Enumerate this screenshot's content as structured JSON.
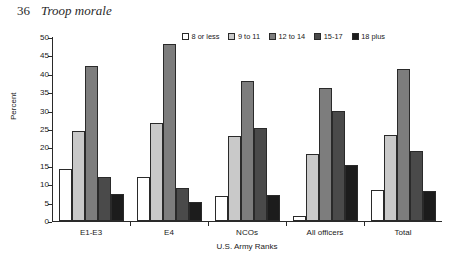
{
  "page": {
    "folio": "36",
    "running_title": "Troop morale"
  },
  "chart_data": {
    "type": "bar",
    "title": "",
    "xlabel": "U.S. Army Ranks",
    "ylabel": "Percent",
    "ylim": [
      0,
      50
    ],
    "ytick_step": 5,
    "yticks": [
      "0",
      "5",
      "10",
      "15",
      "20",
      "25",
      "30",
      "35",
      "40",
      "45",
      "50"
    ],
    "grid": false,
    "legend_position": "top-right",
    "categories": [
      "E1-E3",
      "E4",
      "NCOs",
      "All officers",
      "Total"
    ],
    "series": [
      {
        "name": "8 or less",
        "color": "#ffffff",
        "values": [
          14.2,
          12.0,
          6.7,
          1.3,
          8.5
        ]
      },
      {
        "name": "9 to 11",
        "color": "#c9c9c9",
        "values": [
          24.5,
          26.6,
          23.0,
          18.1,
          23.5
        ]
      },
      {
        "name": "12 to 14",
        "color": "#7d7d7d",
        "values": [
          42.2,
          48.0,
          38.1,
          36.2,
          41.3
        ]
      },
      {
        "name": "15-17",
        "color": "#4a4a4a",
        "values": [
          12.0,
          8.9,
          25.4,
          29.8,
          18.9
        ]
      },
      {
        "name": "18 plus",
        "color": "#1c1c1c",
        "values": [
          7.4,
          5.3,
          7.1,
          15.1,
          8.1
        ]
      }
    ]
  }
}
